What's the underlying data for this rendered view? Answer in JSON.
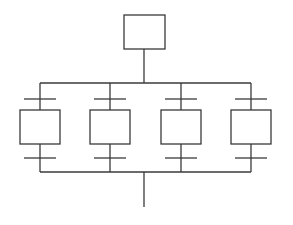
{
  "diagram": {
    "type": "grafcet-parallel-divergence",
    "stroke_color": "#3a3a3a",
    "background": "#ffffff",
    "initial_step": {
      "x": 124,
      "y": 15,
      "w": 41,
      "h": 34,
      "label": ""
    },
    "stem_x": 144,
    "top_bus": {
      "y": 83,
      "x1": 40,
      "x2": 251
    },
    "bottom_bus": {
      "y": 172,
      "x1": 40,
      "x2": 251
    },
    "exit_line": {
      "x": 144,
      "y1": 172,
      "y2": 207
    },
    "branches": [
      {
        "cx": 40,
        "label": ""
      },
      {
        "cx": 110,
        "label": ""
      },
      {
        "cx": 181,
        "label": ""
      },
      {
        "cx": 251,
        "label": ""
      }
    ],
    "step_box": {
      "y": 110,
      "w": 40,
      "h": 34
    },
    "upper_transition_y": 99,
    "lower_transition_y": 158,
    "transition_width": 32
  }
}
